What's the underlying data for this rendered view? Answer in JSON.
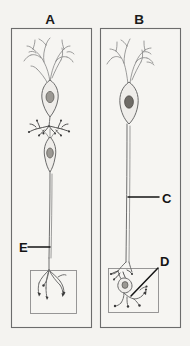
{
  "figure": {
    "name": "neuron-comparison-figure",
    "background_color": "#f4f3f0",
    "ink_color": "#6f6f6f",
    "label_color": "#141414",
    "panels": [
      {
        "id": "A",
        "label": "A",
        "description": "Two-neuron chain: upper neuron with branched dendrites, soma and nucleus; its axon terminals synapse on a second spindle-shaped neuron, whose long axon descends to a terminal arborization inside a detail box.",
        "callouts": [
          {
            "id": "E",
            "label": "E",
            "target": "axon of second neuron",
            "leader": "horizontal"
          }
        ],
        "detail_box": {
          "name": "terminal-arborization-box",
          "content": "free nerve endings with end bulbs"
        }
      },
      {
        "id": "B",
        "label": "B",
        "description": "Single neuron with branched dendrites, soma and dark nucleus, and a very long axon descending to a small ganglion cell and terminal branches inside a detail box.",
        "callouts": [
          {
            "id": "C",
            "label": "C",
            "target": "long axon",
            "leader": "horizontal"
          },
          {
            "id": "D",
            "label": "D",
            "target": "terminal cell and endings in detail box",
            "leader": "diagonal"
          }
        ],
        "detail_box": {
          "name": "terminal-cell-box",
          "content": "small cell body with nucleus and branching endings"
        }
      }
    ]
  }
}
